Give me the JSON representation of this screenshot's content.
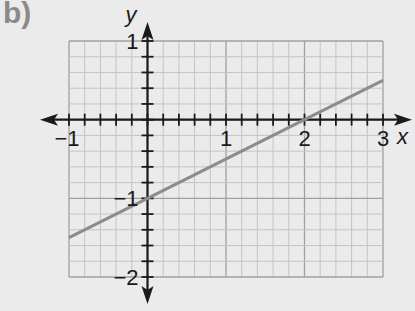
{
  "figure_label": "b)",
  "chart_data": {
    "type": "line",
    "title": "",
    "xlabel": "x",
    "ylabel": "y",
    "xlim": [
      -1,
      3
    ],
    "ylim": [
      -2,
      1
    ],
    "x_ticks": [
      -1,
      1,
      2,
      3
    ],
    "y_ticks": [
      1,
      -1,
      -2
    ],
    "x_tick_labels": [
      "−1",
      "1",
      "2",
      "3"
    ],
    "y_tick_labels": [
      "1",
      "−1",
      "−2"
    ],
    "grid": true,
    "grid_minor_step": 0.2,
    "series": [
      {
        "name": "line",
        "equation": "y = 0.5x - 1",
        "x": [
          -1,
          0,
          2,
          3
        ],
        "y": [
          -1.5,
          -1,
          0,
          0.5
        ],
        "color": "#8c8c8c"
      }
    ],
    "legend": null
  },
  "colors": {
    "background": "#ebebeb",
    "grid_minor": "#c4c4c4",
    "grid_major": "#a0a0a0",
    "axis": "#1a1a1a",
    "line": "#8c8c8c"
  }
}
